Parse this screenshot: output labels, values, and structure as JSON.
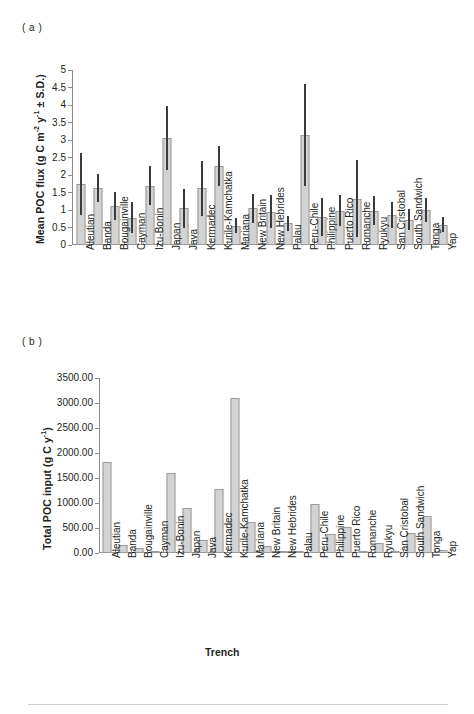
{
  "figure": {
    "panel_a_tag": "( a )",
    "panel_b_tag": "( b )",
    "xaxis_title": "Trench"
  },
  "panel_a": {
    "ylabel_plain": "Mean POC flux (g C m-2 y-1 ± S.D.)",
    "ylabel_parts": {
      "p1": "Mean POC flux (g C m",
      "sup1": "-2",
      "p2": " y",
      "sup2": "-1",
      "p3": " ± S.D.)"
    },
    "yticks": [
      "0",
      "0.5",
      "1",
      "1.5",
      "2",
      "2.5",
      "3",
      "3.5",
      "4",
      "4.5",
      "5"
    ]
  },
  "panel_b": {
    "ylabel_parts": {
      "p1": "Total POC input (g C y",
      "sup1": "-1",
      "p2": ")"
    },
    "yticks": [
      "0.00",
      "500.00",
      "1000.00",
      "1500.00",
      "2000.00",
      "2500.00",
      "3000.00",
      "3500.00"
    ]
  },
  "colors": {
    "bar_fill": "#d3d3d3",
    "bar_border": "#9a9a9a",
    "error_bar": "#3b3b3b",
    "axis": "#8d8d8d",
    "text": "#231f20"
  },
  "chart_data": [
    {
      "type": "bar",
      "panel": "a",
      "title": "( a )",
      "xlabel": "Trench",
      "ylabel": "Mean POC flux (g C m-2 y-1 ± S.D.)",
      "ylim": [
        0,
        5
      ],
      "ytick_step": 0.5,
      "grid": false,
      "legend": "none",
      "error_bars": "standard deviation",
      "categories": [
        "Aleutian",
        "Banda",
        "Bougainville",
        "Cayman",
        "Izu-Bonin",
        "Japan",
        "Java",
        "Kermadec",
        "Kurile-Kamchatka",
        "Mariana",
        "New Britain",
        "New Hebrides",
        "Palau",
        "Peru-Chile",
        "Philippine",
        "Puerto Rico",
        "Romanche",
        "Ryukyu",
        "San Cristobal",
        "South Sandwich",
        "Tonga",
        "Yap"
      ],
      "values": [
        1.75,
        1.62,
        1.12,
        0.78,
        1.7,
        3.05,
        1.05,
        1.62,
        2.25,
        0.55,
        1.05,
        0.95,
        0.62,
        3.15,
        0.8,
        0.98,
        1.32,
        0.98,
        0.85,
        0.72,
        1.0,
        0.58
      ],
      "errors_upper": [
        0.88,
        0.4,
        0.4,
        0.45,
        0.55,
        0.92,
        0.55,
        0.78,
        0.57,
        0.22,
        0.42,
        0.47,
        0.22,
        1.45,
        0.55,
        0.45,
        1.1,
        0.42,
        0.37,
        0.3,
        0.35,
        0.22
      ],
      "errors_lower": [
        0.88,
        0.4,
        0.4,
        0.45,
        0.55,
        0.92,
        0.55,
        0.78,
        0.57,
        0.22,
        0.42,
        0.47,
        0.22,
        1.45,
        0.55,
        0.45,
        1.1,
        0.42,
        0.37,
        0.3,
        0.35,
        0.22
      ]
    },
    {
      "type": "bar",
      "panel": "b",
      "title": "( b )",
      "xlabel": "Trench",
      "ylabel": "Total POC input (g C y-1)",
      "ylim": [
        0,
        3500
      ],
      "ytick_step": 500,
      "grid": false,
      "legend": "none",
      "categories": [
        "Aleutian",
        "Banda",
        "Bougainville",
        "Cayman",
        "Izu-Bonin",
        "Japan",
        "Java",
        "Kermadec",
        "Kurile-Kamchatka",
        "Mariana",
        "New Britain",
        "New Hebrides",
        "Palau",
        "Peru-Chile",
        "Philippine",
        "Puerto Rico",
        "Romanche",
        "Ryukyu",
        "San Cristobal",
        "South Sandwich",
        "Tonga",
        "Yap"
      ],
      "values": [
        1830,
        165,
        105,
        35,
        1600,
        900,
        270,
        1285,
        3110,
        620,
        135,
        30,
        18,
        990,
        390,
        520,
        25,
        195,
        40,
        400,
        740,
        60
      ]
    }
  ]
}
